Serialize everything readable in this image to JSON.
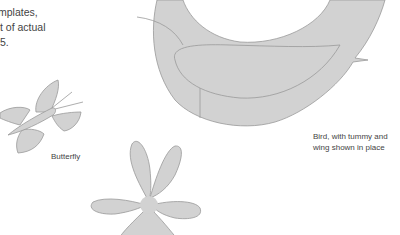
{
  "intro_text": {
    "lines": [
      "mplates,",
      "t of actual",
      "5."
    ]
  },
  "captions": {
    "butterfly": "Butterfly",
    "bird_line1": "Bird, with tummy and",
    "bird_line2": "wing shown in place"
  },
  "colors": {
    "shape_fill": "#d2d2d2",
    "shape_stroke": "#999999",
    "text": "#444444",
    "background": "#ffffff"
  }
}
